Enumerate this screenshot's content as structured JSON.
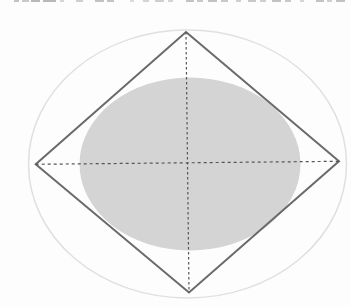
{
  "figure": {
    "background_color": "#fdfdfd",
    "cropped_text_marks": {
      "color": "#8a8a8a",
      "segments": [
        [
          14,
          5,
          0.5
        ],
        [
          22,
          7,
          0.45
        ],
        [
          31,
          9,
          0.6
        ],
        [
          43,
          13,
          0.6
        ],
        [
          60,
          4,
          0.35
        ],
        [
          76,
          7,
          0.4
        ],
        [
          95,
          9,
          0.5
        ],
        [
          107,
          7,
          0.5
        ],
        [
          130,
          4,
          0.3
        ],
        [
          143,
          6,
          0.35
        ],
        [
          155,
          9,
          0.4
        ],
        [
          168,
          5,
          0.35
        ],
        [
          186,
          8,
          0.5
        ],
        [
          197,
          6,
          0.45
        ],
        [
          208,
          9,
          0.5
        ],
        [
          221,
          7,
          0.45
        ],
        [
          236,
          5,
          0.4
        ],
        [
          248,
          8,
          0.45
        ],
        [
          260,
          6,
          0.4
        ],
        [
          272,
          9,
          0.5
        ],
        [
          285,
          6,
          0.45
        ],
        [
          300,
          4,
          0.35
        ],
        [
          316,
          8,
          0.5
        ],
        [
          327,
          5,
          0.4
        ],
        [
          336,
          9,
          0.5
        ]
      ]
    },
    "diagram": {
      "canvas": {
        "width": 351,
        "height": 307
      },
      "outer_ellipse": {
        "cx": 187.5,
        "cy": 164,
        "rx": 159,
        "ry": 134,
        "stroke": "#e0e0e0",
        "stroke_width": 1.5,
        "fill": "none"
      },
      "inner_ellipse": {
        "cx": 190,
        "cy": 164,
        "rx": 110.5,
        "ry": 86.5,
        "fill": "#d4d4d4",
        "stroke": "none"
      },
      "rhombus": {
        "points": [
          [
            186,
            32
          ],
          [
            339,
            161.3
          ],
          [
            189,
            292.5
          ],
          [
            35.7,
            164.3
          ]
        ],
        "stroke": "#6a6a6a",
        "stroke_width": 2,
        "fill": "none"
      },
      "horizontal_axis": {
        "x1": 35.7,
        "y1": 164.3,
        "x2": 339,
        "y2": 161.3,
        "stroke": "#555555",
        "stroke_width": 1.2,
        "dash": "3,3"
      },
      "vertical_axis": {
        "x1": 186,
        "y1": 32,
        "x2": 189,
        "y2": 292.5,
        "stroke": "#555555",
        "stroke_width": 1.2,
        "dash": "2.5,2.5"
      }
    }
  }
}
